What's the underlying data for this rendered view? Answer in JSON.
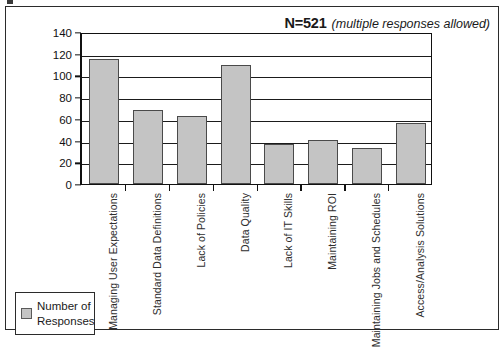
{
  "annotation": {
    "n_value": "N=521",
    "qualifier": "(multiple responses allowed)"
  },
  "legend": {
    "label": "Number of Responses",
    "swatch_color": "#c4c4c4"
  },
  "chart_data": {
    "type": "bar",
    "title": "",
    "subtitle": "",
    "xlabel": "",
    "ylabel": "",
    "ylim": [
      0,
      140
    ],
    "ytick_step": 20,
    "ytick_labels": [
      "0",
      "20",
      "40",
      "60",
      "80",
      "100",
      "120",
      "140"
    ],
    "grid": true,
    "legend_position": "bottom-left",
    "series_name": "Number of Responses",
    "bar_color": "#c4c4c4",
    "bar_border_color": "#4a4a4a",
    "categories": [
      "Managing User Expectations",
      "Standard Data Definitions",
      "Lack of Policies",
      "Data Quality",
      "Lack of IT Skills",
      "Maintaining ROI",
      "Maintaining Jobs and Schedules",
      "Access/Analysis Solutions"
    ],
    "values": [
      115,
      68,
      63,
      110,
      37,
      41,
      33,
      56
    ],
    "annotations": [
      "N=521",
      "(multiple responses allowed)"
    ]
  }
}
